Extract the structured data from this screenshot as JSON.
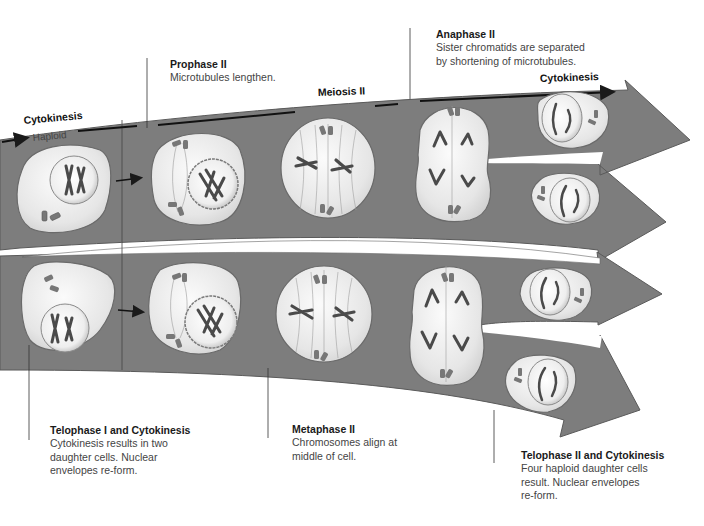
{
  "figure": {
    "title": "Meiosis II",
    "band_labels": {
      "left_cytokinesis": "Cytokinesis",
      "haploid": "Haploid",
      "meiosis_ii": "Meiosis II",
      "right_cytokinesis": "Cytokinesis"
    },
    "colors": {
      "band": "#7b7b7b",
      "band_edge": "#555555",
      "cell_fill": "#e9e9e9",
      "cell_edge": "#6d6d6d",
      "chromosome": "#4a4a4a",
      "centriole": "#707070",
      "background": "#ffffff"
    },
    "stages": [
      {
        "id": "telophase-i",
        "title": "Telophase I and Cytokinesis",
        "description": "Cytokinesis results in two daughter cells. Nuclear envelopes re-form."
      },
      {
        "id": "prophase-ii",
        "title": "Prophase II",
        "description": "Microtubules lengthen."
      },
      {
        "id": "metaphase-ii",
        "title": "Metaphase II",
        "description": "Chromosomes align at middle of cell."
      },
      {
        "id": "anaphase-ii",
        "title": "Anaphase II",
        "description": "Sister chromatids are separated by shortening of microtubules."
      },
      {
        "id": "telophase-ii",
        "title": "Telophase II and Cytokinesis",
        "description": "Four haploid daughter cells result. Nuclear envelopes re-form."
      }
    ],
    "label_lines": {
      "prophase": [
        "Prophase II",
        "Microtubules lengthen."
      ],
      "anaphase": [
        "Anaphase II",
        "Sister chromatids are separated",
        "by shortening of microtubules."
      ],
      "telophase1": [
        "Telophase I and Cytokinesis",
        "Cytokinesis results in two",
        "daughter cells. Nuclear",
        "envelopes re-form."
      ],
      "metaphase": [
        "Metaphase II",
        "Chromosomes align at",
        "middle of cell."
      ],
      "telophase2": [
        "Telophase II and Cytokinesis",
        "Four haploid daughter cells",
        "result. Nuclear envelopes",
        "re-form."
      ]
    }
  }
}
